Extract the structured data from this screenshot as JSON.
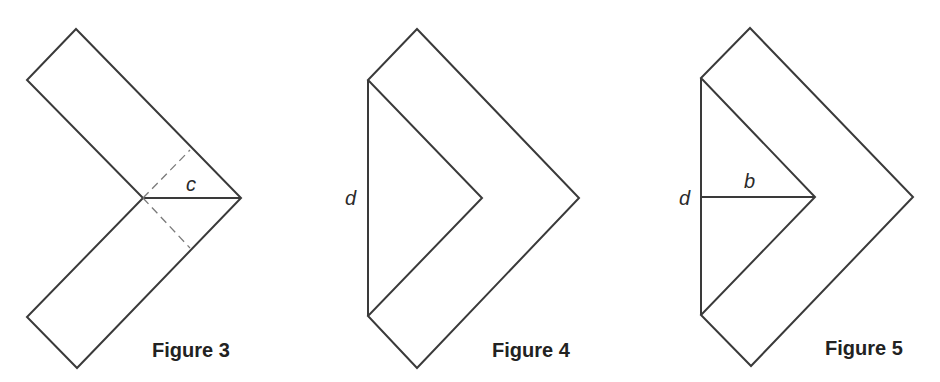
{
  "figures": [
    {
      "caption": "Figure 3",
      "labels": {
        "c": "c"
      },
      "shapes": "L-shaped strip bent at a right angle with a solid diagonal c and dashed fold lines"
    },
    {
      "caption": "Figure 4",
      "labels": {
        "d": "d"
      },
      "shapes": "Bent strip with vertical segment d closing the inner triangle"
    },
    {
      "caption": "Figure 5",
      "labels": {
        "d": "d",
        "b": "b"
      },
      "shapes": "Bent strip with vertical segment d and horizontal segment b to inner vertex"
    }
  ],
  "colors": {
    "stroke": "#3a3a3a",
    "dash": "#7a7a7a",
    "text": "#222222",
    "background": "#ffffff"
  }
}
